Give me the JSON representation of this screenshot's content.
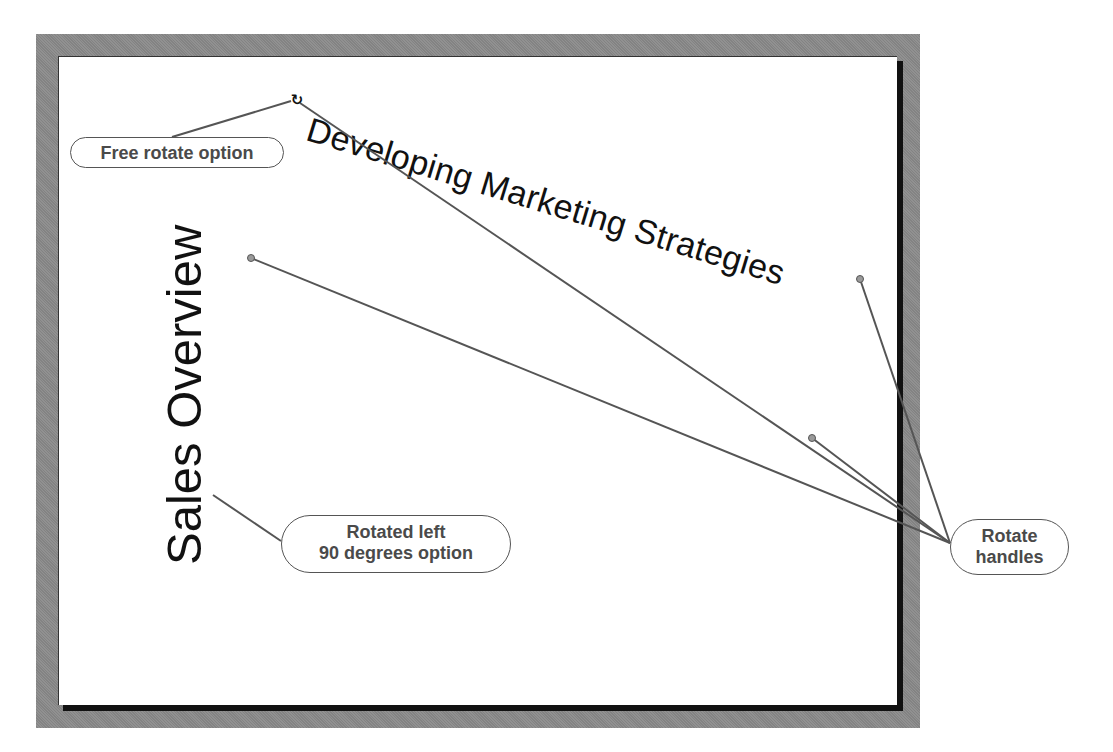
{
  "slide": {
    "title": "Developing Marketing Strategies",
    "title_rotation_deg": 17,
    "subtitle": "Sales Overview",
    "subtitle_rotation_deg": -90
  },
  "callouts": {
    "free_rotate": "Free rotate option",
    "rotated_left": {
      "line1": "Rotated left",
      "line2": "90 degrees option"
    },
    "rotate_handles": {
      "line1": "Rotate",
      "line2": "handles"
    }
  },
  "icons": {
    "free_rotate_handle": "free-rotate-icon",
    "rotate_handle": "rotate-handle-icon",
    "free_rotate_glyph": "↻"
  },
  "colors": {
    "frame": "#8a8a8a",
    "slide": "#ffffff",
    "shadow": "#111111",
    "callout_text": "#4a4a4a",
    "leader_line": "#555555",
    "handle_fill": "#9a9a9a"
  }
}
